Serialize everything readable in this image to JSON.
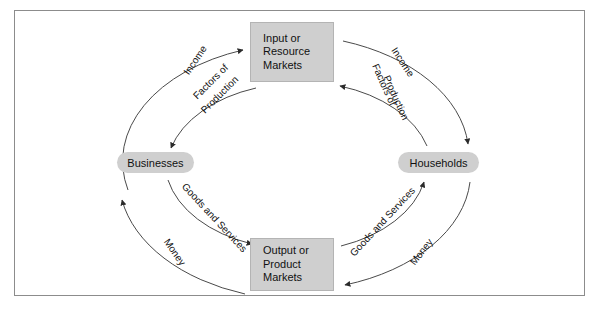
{
  "diagram": {
    "type": "circular-flow",
    "frame": {
      "border_color": "#8c8c8c",
      "background": "#ffffff"
    },
    "node_fill": "#cfcfcf",
    "line_color": "#4a4a4a",
    "nodes": {
      "input_markets": {
        "line1": "Input or",
        "line2": "Resource",
        "line3": "Markets"
      },
      "output_markets": {
        "line1": "Output or",
        "line2": "Product",
        "line3": "Markets"
      },
      "businesses": {
        "label": "Businesses"
      },
      "households": {
        "label": "Households"
      }
    },
    "flows": {
      "outer_left_up": {
        "label": "Income",
        "from": "Businesses",
        "to": "Input or Resource Markets"
      },
      "inner_left_down": {
        "label_line1": "Factors of",
        "label_line2": "Production",
        "from": "Input or Resource Markets",
        "to": "Businesses"
      },
      "outer_right_down": {
        "label": "Income",
        "from": "Input or Resource Markets",
        "to": "Households"
      },
      "inner_right_up": {
        "label_line1": "Factors of",
        "label_line2": "Production",
        "from": "Households",
        "to": "Input or Resource Markets"
      },
      "inner_left_lower": {
        "label": "Goods and Services",
        "from": "Businesses",
        "to": "Output or Product Markets"
      },
      "outer_left_lower": {
        "label": "Money",
        "from": "Output or Product Markets",
        "to": "Businesses"
      },
      "inner_right_lower": {
        "label": "Goods and Services",
        "from": "Output or Product Markets",
        "to": "Households"
      },
      "outer_right_lower": {
        "label": "Money",
        "from": "Households",
        "to": "Output or Product Markets"
      }
    }
  }
}
